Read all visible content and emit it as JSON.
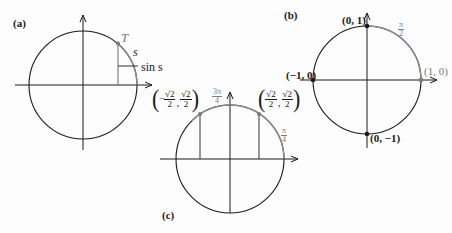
{
  "figure": {
    "panels": [
      {
        "id": "a",
        "tag": "(a)",
        "point_label": "T",
        "arc_label": "s",
        "segment_label": "sin s"
      },
      {
        "id": "b",
        "tag": "(b)",
        "points": [
          {
            "label": "(0, 1)"
          },
          {
            "label": "(−1, 0)"
          },
          {
            "label": "(1, 0)"
          },
          {
            "label": "(0, −1)"
          }
        ],
        "arc_label": {
          "num": "π",
          "den": "2"
        }
      },
      {
        "id": "c",
        "tag": "(c)",
        "left_point": {
          "x_sign": "−",
          "x_num": "√2",
          "x_den": "2",
          "y_num": "√2",
          "y_den": "2"
        },
        "right_point": {
          "x_num": "√2",
          "x_den": "2",
          "y_num": "√2",
          "y_den": "2"
        },
        "arc_label_left": {
          "num": "3π",
          "den": "4"
        },
        "arc_label_right": {
          "num": "π",
          "den": "4"
        }
      }
    ],
    "colors": {
      "ink": "#1a1a1a",
      "highlight_arc": "#8a8a8a",
      "point": "#7a7a7a"
    }
  }
}
